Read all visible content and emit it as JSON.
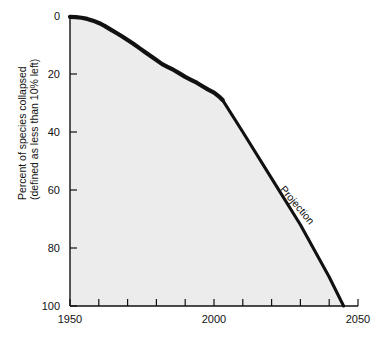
{
  "chart_data": {
    "type": "line",
    "title": "",
    "subtitle": "",
    "xlabel": "",
    "ylabel_line1": "Percent of species collapsed",
    "ylabel_line2": "(defined as less than 10% left)",
    "xlim": [
      1950,
      2050
    ],
    "ylim": [
      0,
      100
    ],
    "y_axis_inverted": true,
    "grid": false,
    "legend": "none",
    "background_fill_under_curve": "#ececec",
    "line_color": "#111111",
    "x_ticks_major": [
      1950,
      2000,
      2050
    ],
    "x_tick_labels": [
      "1950",
      "2000",
      "2050"
    ],
    "x_ticks_minor": [
      1960,
      1970,
      1980,
      1990,
      2010,
      2020,
      2030,
      2040
    ],
    "y_ticks": [
      0,
      20,
      40,
      60,
      80,
      100
    ],
    "y_tick_labels": [
      "0",
      "20",
      "40",
      "60",
      "80",
      "100"
    ],
    "annotations": [
      {
        "text": "Projection",
        "x": 2028,
        "y": 66,
        "rotation": 50
      }
    ],
    "series": [
      {
        "name": "Historical",
        "style": "solid-thick-jagged",
        "x": [
          1950,
          1952,
          1954,
          1956,
          1958,
          1960,
          1962,
          1964,
          1966,
          1968,
          1970,
          1972,
          1974,
          1976,
          1978,
          1980,
          1982,
          1984,
          1986,
          1988,
          1990,
          1992,
          1994,
          1996,
          1998,
          2000,
          2002,
          2003
        ],
        "values": [
          0.3,
          0.4,
          0.6,
          1.0,
          1.6,
          2.4,
          3.4,
          4.6,
          5.8,
          7.0,
          8.3,
          9.6,
          11.0,
          12.4,
          13.8,
          15.2,
          16.6,
          17.6,
          18.6,
          19.8,
          21.0,
          22.0,
          23.0,
          24.2,
          25.4,
          26.4,
          28.0,
          29.0
        ]
      },
      {
        "name": "Projection",
        "style": "solid-thick-straight",
        "x": [
          2003,
          2010,
          2020,
          2030,
          2040,
          2045
        ],
        "values": [
          29.0,
          40.0,
          56.0,
          72.0,
          90.0,
          100.0
        ]
      }
    ]
  }
}
